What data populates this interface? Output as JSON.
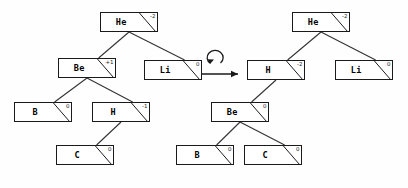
{
  "diagram": {
    "node_width": 58,
    "node_height": 20,
    "colors": {
      "background": "#fefefe",
      "node_fill": "#ffffff",
      "stroke": "#1a1a1a",
      "edge": "#333333",
      "text": "#000000"
    },
    "operator": {
      "name": "rotation-arrow",
      "kind": "rotate-right-arrow"
    },
    "trees": [
      {
        "name": "before",
        "nodes": [
          {
            "id": "L-he",
            "label": "He",
            "balance": "-2",
            "x": 100,
            "y": 12
          },
          {
            "id": "L-be",
            "label": "Be",
            "balance": "+1",
            "x": 58,
            "y": 58
          },
          {
            "id": "L-li",
            "label": "Li",
            "balance": "0",
            "x": 144,
            "y": 60
          },
          {
            "id": "L-b",
            "label": "B",
            "balance": "0",
            "x": 14,
            "y": 102
          },
          {
            "id": "L-h",
            "label": "H",
            "balance": "-1",
            "x": 92,
            "y": 102
          },
          {
            "id": "L-c",
            "label": "C",
            "balance": "0",
            "x": 56,
            "y": 145
          }
        ],
        "edges": [
          {
            "from": "L-he",
            "to": "L-be"
          },
          {
            "from": "L-he",
            "to": "L-li"
          },
          {
            "from": "L-be",
            "to": "L-b"
          },
          {
            "from": "L-be",
            "to": "L-h"
          },
          {
            "from": "L-h",
            "to": "L-c"
          }
        ]
      },
      {
        "name": "after",
        "nodes": [
          {
            "id": "R-he",
            "label": "He",
            "balance": "-2",
            "x": 292,
            "y": 12
          },
          {
            "id": "R-h",
            "label": "H",
            "balance": "-2",
            "x": 247,
            "y": 60
          },
          {
            "id": "R-li",
            "label": "Li",
            "balance": "0",
            "x": 335,
            "y": 60
          },
          {
            "id": "R-be",
            "label": "Be",
            "balance": "0",
            "x": 211,
            "y": 102
          },
          {
            "id": "R-b",
            "label": "B",
            "balance": "0",
            "x": 176,
            "y": 145
          },
          {
            "id": "R-c",
            "label": "C",
            "balance": "0",
            "x": 244,
            "y": 145
          }
        ],
        "edges": [
          {
            "from": "R-he",
            "to": "R-h"
          },
          {
            "from": "R-he",
            "to": "R-li"
          },
          {
            "from": "R-h",
            "to": "R-be"
          },
          {
            "from": "R-be",
            "to": "R-b"
          },
          {
            "from": "R-be",
            "to": "R-c"
          }
        ]
      }
    ]
  }
}
